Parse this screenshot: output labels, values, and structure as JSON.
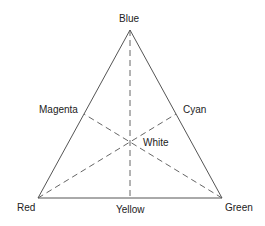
{
  "diagram": {
    "type": "color-triangle",
    "vertices": {
      "top": {
        "label": "Blue"
      },
      "bottom_left": {
        "label": "Red"
      },
      "bottom_right": {
        "label": "Green"
      }
    },
    "edge_midpoints": {
      "left": {
        "label": "Magenta"
      },
      "right": {
        "label": "Cyan"
      },
      "bottom": {
        "label": "Yellow"
      }
    },
    "center": {
      "label": "White"
    },
    "colors": {
      "stroke": "#555555",
      "text": "#222222",
      "background": "#ffffff"
    }
  }
}
